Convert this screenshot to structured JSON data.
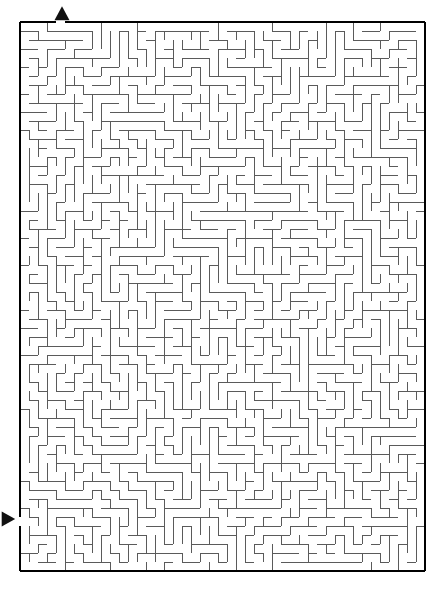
{
  "page": {
    "background_color": "#ffffff",
    "width": 443,
    "height": 591
  },
  "maze": {
    "type": "orthogonal-perfect-maze",
    "origin_x": 20,
    "origin_y": 22,
    "cell_size": 9,
    "columns": 45,
    "rows": 61,
    "border_color": "#000000",
    "border_width": 2,
    "wall_color": "#5a5a5a",
    "wall_width": 1,
    "entrance": {
      "label": "entrance",
      "side": "top",
      "cell_column": 4,
      "marker": "triangle-up",
      "marker_color": "#111111",
      "marker_center_x": 62,
      "marker_center_y": 14,
      "marker_size": 15
    },
    "exit": {
      "label": "exit",
      "side": "left",
      "cell_row": 55,
      "marker": "triangle-right",
      "marker_color": "#111111",
      "marker_center_x": 8,
      "marker_center_y": 519,
      "marker_size": 15
    },
    "seed": 20240517
  }
}
